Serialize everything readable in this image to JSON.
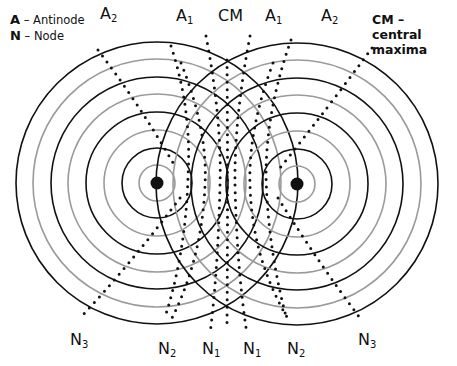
{
  "legend": {
    "items": [
      {
        "key": "A",
        "desc": "– Antinode"
      },
      {
        "key": "N",
        "desc": "– Node"
      }
    ],
    "cm": {
      "line1": "CM – central",
      "line2": "maxima"
    }
  },
  "top_labels": [
    {
      "base": "A",
      "sub": "2",
      "x": 100,
      "y": 6
    },
    {
      "base": "A",
      "sub": "1",
      "x": 176,
      "y": 8
    },
    {
      "base": "CM",
      "sub": "",
      "x": 218,
      "y": 8
    },
    {
      "base": "A",
      "sub": "1",
      "x": 265,
      "y": 8
    },
    {
      "base": "A",
      "sub": "2",
      "x": 321,
      "y": 8
    }
  ],
  "bottom_labels": [
    {
      "base": "N",
      "sub": "3",
      "x": 70,
      "y": 332
    },
    {
      "base": "N",
      "sub": "2",
      "x": 158,
      "y": 341
    },
    {
      "base": "N",
      "sub": "1",
      "x": 202,
      "y": 341
    },
    {
      "base": "N",
      "sub": "1",
      "x": 243,
      "y": 341
    },
    {
      "base": "N",
      "sub": "2",
      "x": 287,
      "y": 341
    },
    {
      "base": "N",
      "sub": "3",
      "x": 358,
      "y": 332
    }
  ],
  "sources": [
    {
      "name": "left-source",
      "cx": 157,
      "cy": 183
    },
    {
      "name": "right-source",
      "cx": 297,
      "cy": 184
    }
  ],
  "wavefront_radii": [
    18,
    35,
    53,
    71,
    89,
    106,
    124,
    141
  ],
  "colors": {
    "crest": "#111111",
    "trough": "#9a9a9a",
    "dots": "#111111"
  }
}
